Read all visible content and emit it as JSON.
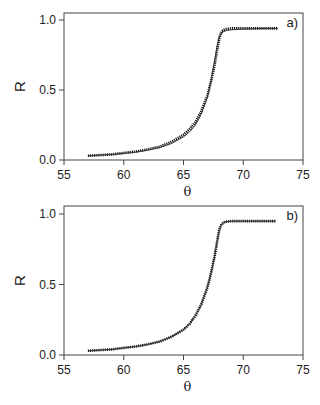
{
  "chart_data": [
    {
      "type": "line",
      "panel_label": "a)",
      "title": "",
      "xlabel": "θ",
      "ylabel": "R",
      "xlim": [
        55,
        75
      ],
      "ylim": [
        0,
        1.05
      ],
      "xticks": [
        55,
        60,
        65,
        70,
        75
      ],
      "yticks": [
        0.0,
        0.5,
        1.0
      ],
      "xtick_labels": [
        "55",
        "60",
        "65",
        "70",
        "75"
      ],
      "ytick_labels": [
        "0.0",
        "0.5",
        "1.0"
      ],
      "grid": false,
      "legend": "none",
      "series": [
        {
          "name": "measured (dots)",
          "style": "dotted",
          "x": [
            57.0,
            58.0,
            59.0,
            60.0,
            61.0,
            62.0,
            63.0,
            64.0,
            65.0,
            65.5,
            66.0,
            66.5,
            67.0,
            67.3,
            67.6,
            67.8,
            68.0,
            68.2,
            68.5,
            69.0,
            70.0,
            71.0,
            72.0,
            72.9
          ],
          "y": [
            0.03,
            0.035,
            0.04,
            0.05,
            0.06,
            0.075,
            0.095,
            0.13,
            0.18,
            0.22,
            0.27,
            0.35,
            0.46,
            0.56,
            0.68,
            0.78,
            0.87,
            0.92,
            0.935,
            0.94,
            0.94,
            0.94,
            0.94,
            0.94
          ]
        },
        {
          "name": "fit (thin line)",
          "style": "solid",
          "x": [
            57.0,
            58.0,
            59.0,
            60.0,
            61.0,
            62.0,
            63.0,
            64.0,
            65.0,
            65.5,
            66.0,
            66.5,
            67.0,
            67.3,
            67.6,
            67.8,
            68.0,
            68.3,
            68.6,
            69.0,
            70.0,
            71.0,
            72.0,
            72.9
          ],
          "y": [
            0.03,
            0.034,
            0.039,
            0.047,
            0.056,
            0.07,
            0.088,
            0.118,
            0.165,
            0.2,
            0.25,
            0.33,
            0.45,
            0.57,
            0.71,
            0.81,
            0.88,
            0.915,
            0.925,
            0.93,
            0.935,
            0.938,
            0.94,
            0.94
          ]
        }
      ]
    },
    {
      "type": "line",
      "panel_label": "b)",
      "title": "",
      "xlabel": "θ",
      "ylabel": "R",
      "xlim": [
        55,
        75
      ],
      "ylim": [
        0,
        1.05
      ],
      "xticks": [
        55,
        60,
        65,
        70,
        75
      ],
      "yticks": [
        0.0,
        0.5,
        1.0
      ],
      "xtick_labels": [
        "55",
        "60",
        "65",
        "70",
        "75"
      ],
      "ytick_labels": [
        "0.0",
        "0.5",
        "1.0"
      ],
      "grid": false,
      "legend": "none",
      "series": [
        {
          "name": "measured (dots)",
          "style": "dotted",
          "x": [
            57.0,
            58.0,
            59.0,
            60.0,
            61.0,
            62.0,
            63.0,
            64.0,
            65.0,
            65.5,
            66.0,
            66.5,
            67.0,
            67.3,
            67.6,
            67.8,
            68.0,
            68.2,
            68.5,
            69.0,
            70.0,
            71.0,
            72.0,
            72.7
          ],
          "y": [
            0.03,
            0.035,
            0.04,
            0.05,
            0.06,
            0.075,
            0.095,
            0.13,
            0.18,
            0.22,
            0.28,
            0.36,
            0.48,
            0.58,
            0.7,
            0.8,
            0.89,
            0.93,
            0.945,
            0.95,
            0.95,
            0.95,
            0.95,
            0.95
          ]
        },
        {
          "name": "fit (line)",
          "style": "solid",
          "x": [
            57.0,
            58.0,
            59.0,
            60.0,
            61.0,
            62.0,
            63.0,
            64.0,
            65.0,
            65.5,
            66.0,
            66.5,
            67.0,
            67.3,
            67.6,
            67.8,
            68.0,
            68.2,
            68.5,
            69.0,
            70.0,
            71.0,
            72.0,
            72.7
          ],
          "y": [
            0.03,
            0.035,
            0.04,
            0.05,
            0.06,
            0.075,
            0.095,
            0.13,
            0.18,
            0.22,
            0.28,
            0.36,
            0.48,
            0.58,
            0.7,
            0.8,
            0.89,
            0.93,
            0.945,
            0.95,
            0.95,
            0.95,
            0.95,
            0.95
          ]
        }
      ]
    }
  ],
  "layout": {
    "panels": [
      {
        "left": 64,
        "right": 303,
        "top": 13,
        "bottom": 160,
        "y_for_1": 20
      },
      {
        "left": 64,
        "right": 303,
        "top": 206,
        "bottom": 355,
        "y_for_1": 214
      }
    ]
  }
}
